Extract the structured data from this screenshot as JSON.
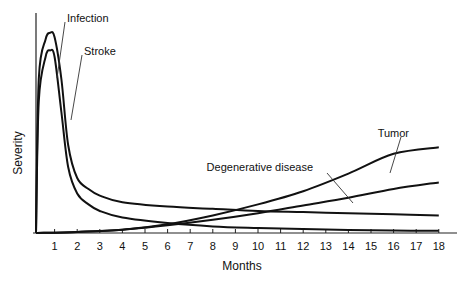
{
  "chart_data": {
    "type": "line",
    "title": "",
    "xlabel": "Months",
    "ylabel": "Severity",
    "x_ticks": [
      1,
      2,
      3,
      4,
      5,
      6,
      7,
      8,
      9,
      10,
      11,
      12,
      13,
      14,
      15,
      16,
      17,
      18
    ],
    "xlim": [
      0,
      18
    ],
    "ylim": [
      0,
      100
    ],
    "grid": false,
    "legend": "inline annotations with leader lines",
    "series": [
      {
        "name": "Infection",
        "x": [
          0,
          0.3,
          0.6,
          0.8,
          1.0,
          1.3,
          1.6,
          2,
          2.5,
          3,
          4,
          6,
          8,
          10,
          12,
          14,
          16,
          18
        ],
        "y": [
          0,
          70,
          88,
          91,
          89,
          70,
          40,
          25,
          20,
          17,
          14,
          12,
          11,
          10,
          9.5,
          9,
          8.5,
          8
        ]
      },
      {
        "name": "Stroke",
        "x": [
          0,
          0.3,
          0.6,
          0.8,
          1.0,
          1.3,
          1.6,
          2,
          2.5,
          3,
          4,
          6,
          8,
          10,
          12,
          14,
          16,
          18
        ],
        "y": [
          0,
          60,
          80,
          83,
          80,
          55,
          30,
          18,
          13,
          10,
          7,
          4.5,
          3,
          2.3,
          1.8,
          1.4,
          1.1,
          1
        ]
      },
      {
        "name": "Tumor",
        "x": [
          0,
          2,
          4,
          6,
          8,
          10,
          12,
          14,
          16,
          18
        ],
        "y": [
          0,
          0.5,
          1.5,
          4,
          8,
          13,
          19,
          27,
          36,
          39
        ]
      },
      {
        "name": "Degenerative disease",
        "x": [
          0,
          2,
          4,
          6,
          8,
          10,
          12,
          14,
          16,
          18
        ],
        "y": [
          0,
          0.5,
          1.5,
          3.5,
          6,
          9,
          12.5,
          16,
          20,
          23
        ]
      }
    ],
    "annotations": [
      {
        "text": "Infection",
        "label_x": 67,
        "label_y": 18
      },
      {
        "text": "Stroke",
        "label_x": 84,
        "label_y": 51
      },
      {
        "text": "Tumor",
        "label_x": 409,
        "label_y": 133
      },
      {
        "text": "Degenerative disease",
        "label_x": 313,
        "label_y": 167
      }
    ]
  }
}
